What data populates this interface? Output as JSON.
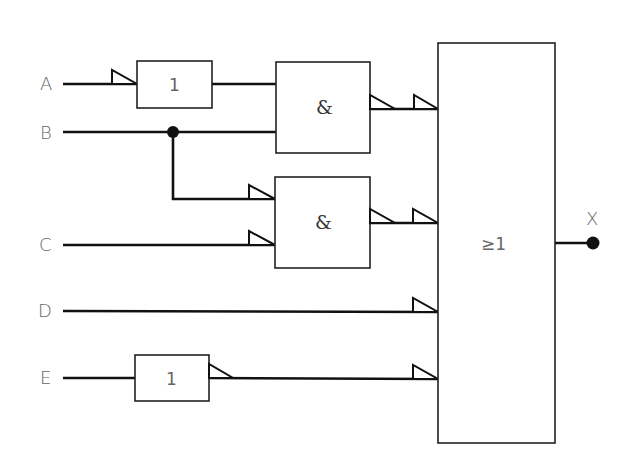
{
  "diagram": {
    "type": "logic-circuit",
    "inputs": [
      {
        "id": "A",
        "label": "A"
      },
      {
        "id": "B",
        "label": "B"
      },
      {
        "id": "C",
        "label": "C"
      },
      {
        "id": "D",
        "label": "D"
      },
      {
        "id": "E",
        "label": "E"
      }
    ],
    "output": {
      "id": "X",
      "label": "X"
    },
    "gates": [
      {
        "id": "not_a",
        "symbol": "1",
        "kind": "NOT",
        "inputs": [
          "A"
        ],
        "output_negated": false,
        "input_negated": true
      },
      {
        "id": "and_1",
        "symbol": "&",
        "kind": "AND",
        "inputs": [
          "not_a",
          "B"
        ],
        "output_negated": true
      },
      {
        "id": "and_2",
        "symbol": "&",
        "kind": "AND",
        "inputs": [
          "B",
          "C"
        ],
        "input_negated": [
          true,
          true
        ],
        "output_negated": true
      },
      {
        "id": "not_e",
        "symbol": "1",
        "kind": "NOT",
        "inputs": [
          "E"
        ],
        "output_negated": true
      },
      {
        "id": "or_1",
        "symbol": "≥1",
        "kind": "OR",
        "inputs": [
          "and_1",
          "and_2",
          "D",
          "not_e"
        ],
        "input_negated": [
          true,
          true,
          true,
          true
        ]
      }
    ],
    "junctions": [
      {
        "net": "B"
      }
    ],
    "colors": {
      "line": "#111111",
      "label": "#666666",
      "background": "#ffffff"
    }
  }
}
